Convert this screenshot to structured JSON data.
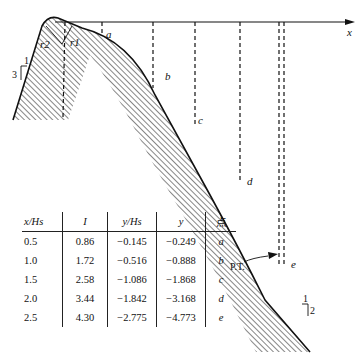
{
  "diagram": {
    "axis_label": "x",
    "upstream_slope": {
      "run": "1",
      "rise": "3"
    },
    "downstream_slope": {
      "run": "1",
      "rise": "2"
    },
    "radius_labels": [
      "r2",
      "r1"
    ],
    "tangent_point_label": "P.T.",
    "points": [
      "a",
      "b",
      "c",
      "d",
      "e"
    ]
  },
  "table": {
    "headers": [
      "x/Hs",
      "I",
      "y/Hs",
      "y",
      "点"
    ],
    "rows": [
      [
        "0.5",
        "0.86",
        "−0.145",
        "−0.249",
        "a"
      ],
      [
        "1.0",
        "1.72",
        "−0.516",
        "−0.888",
        "b"
      ],
      [
        "1.5",
        "2.58",
        "−1.086",
        "−1.868",
        "c"
      ],
      [
        "2.0",
        "3.44",
        "−1.842",
        "−3.168",
        "d"
      ],
      [
        "2.5",
        "4.30",
        "−2.775",
        "−4.773",
        "e"
      ]
    ]
  },
  "colors": {
    "ink": "#111111",
    "background": "#ffffff"
  }
}
